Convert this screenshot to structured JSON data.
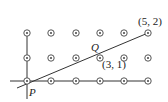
{
  "diagram": {
    "type": "lattice",
    "labels": {
      "origin": "P",
      "midpoint": "Q",
      "point_a": "(3, 1)",
      "point_b": "(5, 2)"
    },
    "grid": {
      "cols": 6,
      "rows": 3
    },
    "colors": {
      "line": "#333333",
      "point": "#444444",
      "background": "#ffffff"
    }
  }
}
